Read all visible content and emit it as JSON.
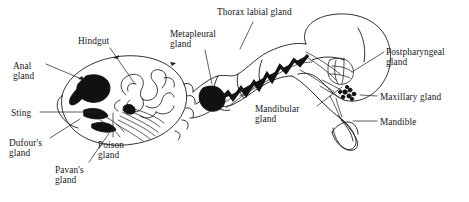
{
  "figure": {
    "type": "anatomical-line-diagram",
    "background_color": "#ffffff",
    "line_color": "#1a1a1a",
    "gland_fill_color": "#111111",
    "organism_regions": [
      "gaster",
      "petiole",
      "thorax",
      "head"
    ]
  },
  "labels": [
    {
      "id": "hindgut",
      "text": "Hindgut",
      "x": 78,
      "y": 36,
      "align": "left"
    },
    {
      "id": "anal-gland",
      "text": "Anal\ngland",
      "x": 13,
      "y": 61,
      "align": "left"
    },
    {
      "id": "sting",
      "text": "Sting",
      "x": 11,
      "y": 108,
      "align": "left"
    },
    {
      "id": "dufours-gland",
      "text": "Dufour's\ngland",
      "x": 9,
      "y": 138,
      "align": "left"
    },
    {
      "id": "pavans-gland",
      "text": "Pavan's\ngland",
      "x": 55,
      "y": 165,
      "align": "left"
    },
    {
      "id": "poison-gland",
      "text": "Poison\ngland",
      "x": 98,
      "y": 140,
      "align": "left"
    },
    {
      "id": "metapleural-gland",
      "text": "Metapleural\ngland",
      "x": 170,
      "y": 29,
      "align": "left"
    },
    {
      "id": "thorax-labial-gland",
      "text": "Thorax labial gland",
      "x": 217,
      "y": 7,
      "align": "left"
    },
    {
      "id": "postpharyngeal-gland",
      "text": "Postpharyngeal\ngland",
      "x": 386,
      "y": 47,
      "align": "left"
    },
    {
      "id": "maxillary-gland",
      "text": "Maxillary gland",
      "x": 380,
      "y": 92,
      "align": "left"
    },
    {
      "id": "mandible",
      "text": "Mandible",
      "x": 380,
      "y": 117,
      "align": "left"
    },
    {
      "id": "mandibular-gland",
      "text": "Mandibular\ngland",
      "x": 255,
      "y": 104,
      "align": "left"
    }
  ],
  "leader_lines": [
    {
      "id": "leader-hindgut",
      "from": [
        110,
        48
      ],
      "to": [
        135,
        84
      ]
    },
    {
      "id": "leader-anal-gland",
      "from": [
        46,
        64
      ],
      "to": [
        82,
        80
      ]
    },
    {
      "id": "leader-sting",
      "from": [
        40,
        112
      ],
      "to": [
        95,
        112
      ]
    },
    {
      "id": "leader-dufours-gland",
      "from": [
        48,
        139
      ],
      "to": [
        79,
        119
      ]
    },
    {
      "id": "leader-pavans-gland",
      "from": [
        88,
        163
      ],
      "to": [
        113,
        129
      ]
    },
    {
      "id": "leader-poison-gland",
      "from": [
        113,
        138
      ],
      "to": [
        113,
        112
      ]
    },
    {
      "id": "leader-metapleural-gland",
      "from": [
        205,
        51
      ],
      "to": [
        212,
        84
      ]
    },
    {
      "id": "leader-thorax-labial-gland",
      "from": [
        253,
        22
      ],
      "to": [
        240,
        48
      ]
    },
    {
      "id": "leader-postpharyngeal-gland",
      "from": [
        384,
        51
      ],
      "to": [
        352,
        72
      ]
    },
    {
      "id": "leader-maxillary-gland",
      "from": [
        378,
        96
      ],
      "to": [
        360,
        96
      ]
    },
    {
      "id": "leader-mandible",
      "from": [
        378,
        121
      ],
      "to": [
        352,
        121
      ]
    },
    {
      "id": "leader-mandibular-gland",
      "from": [
        315,
        107
      ],
      "to": [
        340,
        88
      ]
    }
  ]
}
